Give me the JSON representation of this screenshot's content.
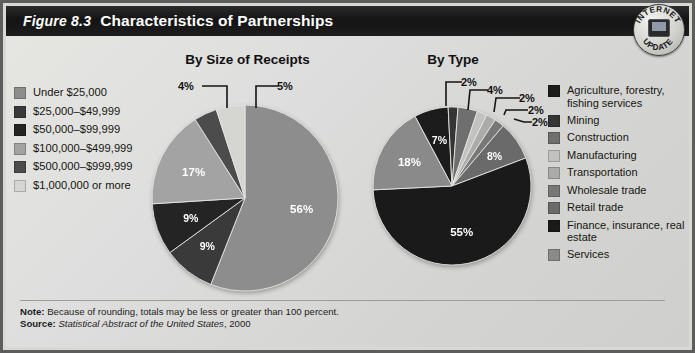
{
  "figure": {
    "number": "Figure 8.3",
    "title": "Characteristics of Partnerships",
    "badge": {
      "line1": "INTERNET",
      "line2": "UPDATE",
      "icon": "computer-icon"
    },
    "note_label": "Note:",
    "note_text": " Because of rounding, totals may be less or greater than 100 percent.",
    "source_label": "Source:",
    "source_title": "Statistical Abstract of the United States",
    "source_year": ", 2000"
  },
  "legend_left": {
    "items": [
      {
        "label": "Under $25,000",
        "color": "#8d8d8d"
      },
      {
        "label": "$25,000–$49,999",
        "color": "#3a3a3a"
      },
      {
        "label": "$50,000–$99,999",
        "color": "#242424"
      },
      {
        "label": "$100,000–$499,999",
        "color": "#a3a3a3"
      },
      {
        "label": "$500,000–$999,999",
        "color": "#4c4c4c"
      },
      {
        "label": "$1,000,000 or more",
        "color": "#d5d5d2"
      }
    ]
  },
  "legend_right": {
    "items": [
      {
        "label": "Agriculture, forestry, fishing services",
        "color": "#1c1c1c"
      },
      {
        "label": "Mining",
        "color": "#353535"
      },
      {
        "label": "Construction",
        "color": "#6f6f6f"
      },
      {
        "label": "Manufacturing",
        "color": "#c2c2c0"
      },
      {
        "label": "Transportation",
        "color": "#ababa9"
      },
      {
        "label": "Wholesale trade",
        "color": "#787878"
      },
      {
        "label": "Retail trade",
        "color": "#6a6a6a"
      },
      {
        "label": "Finance, insurance, real estate",
        "color": "#1a1a1a"
      },
      {
        "label": "Services",
        "color": "#8a8a8a"
      }
    ]
  },
  "chart_data": [
    {
      "type": "pie",
      "title": "By Size of Receipts",
      "categories": [
        "Under $25,000",
        "$25,000–$49,999",
        "$50,000–$99,999",
        "$100,000–$499,999",
        "$500,000–$999,999",
        "$1,000,000 or more"
      ],
      "values": [
        56,
        9,
        9,
        17,
        4,
        5
      ],
      "labels": [
        "56%",
        "9%",
        "9%",
        "17%",
        "4%",
        "5%"
      ],
      "colors": [
        "#8d8d8d",
        "#3a3a3a",
        "#242424",
        "#a3a3a3",
        "#4c4c4c",
        "#d5d5d2"
      ],
      "legend_position": "left",
      "callouts": [
        {
          "text": "4%"
        },
        {
          "text": "5%"
        }
      ]
    },
    {
      "type": "pie",
      "title": "By Type",
      "categories": [
        "Agriculture, forestry, fishing services",
        "Mining",
        "Construction",
        "Manufacturing",
        "Transportation",
        "Wholesale trade",
        "Retail trade",
        "Finance, insurance, real estate",
        "Services"
      ],
      "values": [
        7,
        2,
        4,
        2,
        2,
        2,
        8,
        55,
        18
      ],
      "labels": [
        "7%",
        "2%",
        "4%",
        "2%",
        "2%",
        "2%",
        "8%",
        "55%",
        "18%"
      ],
      "colors": [
        "#1c1c1c",
        "#353535",
        "#6f6f6f",
        "#c2c2c0",
        "#ababa9",
        "#787878",
        "#6a6a6a",
        "#1a1a1a",
        "#8a8a8a"
      ],
      "legend_position": "right",
      "callouts": [
        {
          "text": "2%"
        },
        {
          "text": "4%"
        },
        {
          "text": "2%"
        },
        {
          "text": "2%"
        },
        {
          "text": "2%"
        }
      ]
    }
  ]
}
